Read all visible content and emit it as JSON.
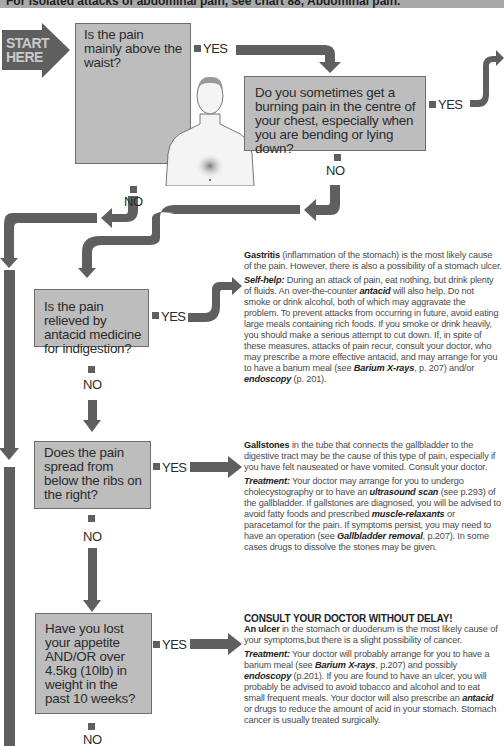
{
  "header": {
    "text": "For isolated attacks of abdominal pain, see chart 88, Abdominal pain."
  },
  "start": {
    "line1": "START",
    "line2": "HERE"
  },
  "colors": {
    "box_fill": "#bdbdbd",
    "arrow": "#5f5f5f",
    "header_bar": "#a9a9a9",
    "text": "#4a4a4a"
  },
  "questions": [
    {
      "id": "q1",
      "text": "Is the pain mainly above the waist?"
    },
    {
      "id": "q2",
      "text": "Do you sometimes get a burning pain in the centre of your chest, especially when you are bending or lying down?"
    },
    {
      "id": "q3",
      "text": "Is the pain relieved by antacid medicine for indigestion?"
    },
    {
      "id": "q4",
      "text": "Does the pain spread from below the ribs on the right?"
    },
    {
      "id": "q5",
      "text": "Have you lost your appetite AND/OR over 4.5kg (10lb) in weight in the past 10 weeks?"
    }
  ],
  "labels": {
    "yes": "YES",
    "no": "NO"
  },
  "answers": {
    "gastritis": {
      "title": "Gastritis",
      "intro": " (inflammation of the stomach) is the most likely cause of the pain. However, there is also a possibility of a stomach ulcer.",
      "selfhelp_label": "Self-help:",
      "selfhelp_1": " During an attack of pain, eat nothing, but drink plenty of fluids. An over-the-counter ",
      "antacid": "antacid",
      "selfhelp_2": " will also help. Do not smoke or drink alcohol, both of which may aggravate the problem. To prevent attacks from  occurring in future, avoid eating large meals containing rich foods. If you smoke or drink heavily, you should make a serious attempt to cut down. If, in spite of these measures, attacks of pain recur, consult your doctor, who may prescribe a more effective antacid, and may arrange for you to have a barium meal (see ",
      "barium": "Barium X-rays",
      "selfhelp_3": ", p. 207) and/or ",
      "endoscopy": "endoscopy",
      "selfhelp_4": " (p. 201)."
    },
    "gallstones": {
      "title": "Gallstones",
      "intro": " in the tube that connects the gallbladder to the digestive tract may be the cause of this type of pain, especially if you have felt nauseated or have vomited. Consult your doctor.",
      "treatment_label": "Treatment:",
      "t1": " Your doctor may arrange for you to undergo cholecystography or to have an ",
      "ultrasound": "ultrasound scan",
      "t2": " (see p.293) of the gallbladder. If gallstones are diagnosed, you will be advised to avoid fatty foods and prescribed ",
      "muscle": "muscle-relaxants",
      "t3": " or paracetamol for the pain. If symptoms persist, you may need to have an operation (see ",
      "gallremoval": "Gallbladder removal",
      "t4": ", p.207). In some cases drugs to dissolve the stones may be given."
    },
    "ulcer": {
      "warning": "CONSULT YOUR DOCTOR WITHOUT DELAY!",
      "title": "An ulcer",
      "intro": " in the stomach or duodenum is the most likely cause of your symptoms,but there is a slight possibility of cancer.",
      "treatment_label": "Treatment:",
      "t1": " Your doctor will probably arrange for you to have a barium meal (see ",
      "barium": "Barium X-rays",
      "t2": ", p.207) and possibly ",
      "endoscopy": "endoscopy",
      "t3": " (p.201). If you are found to have an ulcer, you will probably be advised to avoid tobacco and alcohol and to eat small frequent meals. Your doctor will also prescribe an ",
      "antacid": "antacid",
      "t4": " or drugs to reduce the amount of acid in your stomach. Stomach cancer is usually treated surgically."
    }
  }
}
